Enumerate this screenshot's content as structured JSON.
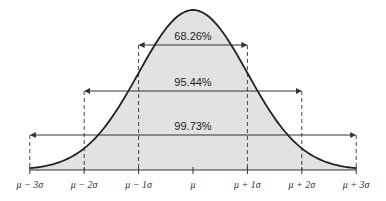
{
  "chart_data": {
    "type": "area",
    "title": "",
    "xlabel": "",
    "ylabel": "",
    "distribution": "normal",
    "tick_labels": [
      "μ − 3σ",
      "μ − 2σ",
      "μ − 1σ",
      "μ",
      "μ + 1σ",
      "μ + 2σ",
      "μ + 3σ"
    ],
    "tick_positions_sigma": [
      -3,
      -2,
      -1,
      0,
      1,
      2,
      3
    ],
    "ranges": [
      {
        "label": "68.26%",
        "from_sigma": -1,
        "to_sigma": 1,
        "value": 68.26
      },
      {
        "label": "95.44%",
        "from_sigma": -2,
        "to_sigma": 2,
        "value": 95.44
      },
      {
        "label": "99.73%",
        "from_sigma": -3,
        "to_sigma": 3,
        "value": 99.73
      }
    ],
    "grid": false,
    "legend": "none",
    "fill_color": "#e2e2e2",
    "curve_color": "#222222"
  }
}
